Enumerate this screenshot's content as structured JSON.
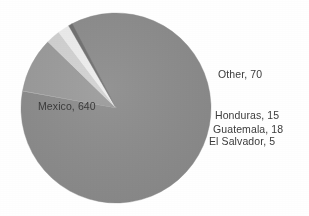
{
  "chart_data": {
    "type": "pie",
    "title": "",
    "subtitle": "",
    "xlabel": "",
    "ylabel": "",
    "legend_position": "none",
    "grid": false,
    "labels_format": "name, value",
    "total": 748,
    "categories": [
      "Mexico",
      "Other",
      "Guatemala",
      "Honduras",
      "El Salvador"
    ],
    "values": [
      640,
      70,
      18,
      15,
      5
    ],
    "slices": [
      {
        "name": "Mexico",
        "value": 640,
        "label": "Mexico, 640",
        "percent": 85.6,
        "color": "#8c8c8c",
        "start_angle_deg": 332.0,
        "end_angle_deg": 640.2,
        "label_placement": "inside-left"
      },
      {
        "name": "Other",
        "value": 70,
        "label": "Other, 70",
        "percent": 9.4,
        "color": "#9b9b9b",
        "start_angle_deg": 280.5,
        "end_angle_deg": 314.2,
        "label_placement": "outside-right"
      },
      {
        "name": "Guatemala",
        "value": 18,
        "label": "Guatemala, 18",
        "percent": 2.4,
        "color": "#d3d3d3",
        "start_angle_deg": 314.2,
        "end_angle_deg": 322.9,
        "label_placement": "outside-right"
      },
      {
        "name": "Honduras",
        "value": 15,
        "label": "Honduras, 15",
        "percent": 2.0,
        "color": "#efefef",
        "start_angle_deg": 322.9,
        "end_angle_deg": 330.1,
        "label_placement": "outside-right"
      },
      {
        "name": "El Salvador",
        "value": 5,
        "label": "El Salvador, 5",
        "percent": 0.7,
        "color": "#6f6f6f",
        "start_angle_deg": 330.1,
        "end_angle_deg": 332.5,
        "label_placement": "outside-right"
      }
    ],
    "geometry": {
      "center_x": 116,
      "center_y": 108,
      "radius": 95
    }
  },
  "labels": {
    "mexico": "Mexico, 640",
    "other": "Other, 70",
    "honduras": "Honduras, 15",
    "guatemala": "Guatemala, 18",
    "el_salvador": "El Salvador, 5"
  },
  "colors": {
    "background": "#ffffff",
    "mexico_slice": "#8c8c8c",
    "other_slice": "#9b9b9b",
    "guatemala_slice": "#d3d3d3",
    "honduras_slice": "#efefef",
    "el_salvador_slice": "#6f6f6f",
    "label_text": "#3b3b3b"
  }
}
